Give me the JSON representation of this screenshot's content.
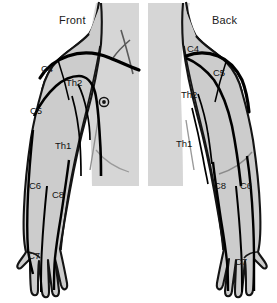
{
  "figure": {
    "type": "anatomical-dermatome-diagram",
    "background_color": "#ffffff",
    "body_fill_color": "#cccccc",
    "torso_fill_color": "#d4d4d4",
    "outline_color": "#111111",
    "nerve_line_color": "#000000"
  },
  "panels": [
    {
      "id": "front",
      "title": "Front",
      "side": "left",
      "labels": [
        {
          "id": "f-c4",
          "text": "C4"
        },
        {
          "id": "f-th2",
          "text": "Th2"
        },
        {
          "id": "f-c5",
          "text": "C5"
        },
        {
          "id": "f-th1",
          "text": "Th1"
        },
        {
          "id": "f-c6",
          "text": "C6"
        },
        {
          "id": "f-c8",
          "text": "C8"
        },
        {
          "id": "f-c7",
          "text": "C7"
        }
      ],
      "markers": [
        {
          "id": "nipple-marker",
          "shape": "target-dot"
        }
      ]
    },
    {
      "id": "back",
      "title": "Back",
      "side": "right",
      "labels": [
        {
          "id": "b-c4",
          "text": "C4"
        },
        {
          "id": "b-c5",
          "text": "C5"
        },
        {
          "id": "b-th2",
          "text": "Th2"
        },
        {
          "id": "b-th1",
          "text": "Th1"
        },
        {
          "id": "b-c8",
          "text": "C8"
        },
        {
          "id": "b-c6",
          "text": "C6"
        },
        {
          "id": "b-c7",
          "text": "C7"
        }
      ],
      "markers": []
    }
  ]
}
